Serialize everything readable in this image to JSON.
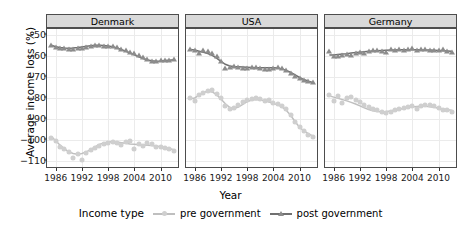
{
  "chart_data": {
    "type": "scatter",
    "title": "",
    "xlabel": "Year",
    "ylabel": "Average income loss (%)",
    "xlim": [
      1984,
      2014
    ],
    "ylim": [
      -114,
      -47
    ],
    "xticks": [
      1986,
      1992,
      1998,
      2004,
      2010
    ],
    "yticks": [
      -50,
      -60,
      -70,
      -80,
      -90,
      -100,
      -110
    ],
    "grid": true,
    "legend_position": "bottom",
    "legend_title": "Income type",
    "facet_variable": "country",
    "facets": [
      "Denmark",
      "USA",
      "Germany"
    ],
    "series_names": [
      "pre government",
      "post government"
    ],
    "colors": {
      "pre_government": "#cfcfcf",
      "post_government": "#8c8c8c",
      "pre_government_line": "#bfbfbf",
      "post_government_line": "#707070",
      "strip_background": "#d9d9d9",
      "panel_border": "#4d4d4d",
      "gridline": "#ebebeb",
      "text": "#000000"
    },
    "panels": [
      {
        "name": "Denmark",
        "series": [
          {
            "name": "pre government",
            "marker": "circle",
            "x": [
              1985,
              1986,
              1987,
              1988,
              1989,
              1990,
              1991,
              1992,
              1993,
              1994,
              1995,
              1996,
              1997,
              1998,
              1999,
              2000,
              2001,
              2002,
              2003,
              2004,
              2005,
              2006,
              2007,
              2008,
              2009,
              2010,
              2011,
              2012,
              2013
            ],
            "y": [
              -99.0,
              -100.5,
              -103.5,
              -104.5,
              -106.0,
              -108.5,
              -107.0,
              -109.5,
              -106.5,
              -105.0,
              -104.0,
              -103.0,
              -102.0,
              -101.5,
              -101.0,
              -101.5,
              -102.5,
              -101.0,
              -100.5,
              -104.5,
              -102.0,
              -103.0,
              -101.5,
              -102.0,
              -103.5,
              -103.5,
              -104.0,
              -104.5,
              -105.5
            ],
            "smooth": [
              -98.5,
              -100.5,
              -102.6,
              -104.4,
              -105.8,
              -106.6,
              -106.9,
              -106.6,
              -105.8,
              -104.7,
              -103.4,
              -102.3,
              -101.5,
              -101.1,
              -101.0,
              -101.1,
              -101.4,
              -101.7,
              -102.0,
              -102.2,
              -102.4,
              -102.5,
              -102.6,
              -102.8,
              -103.0,
              -103.3,
              -103.7,
              -104.2,
              -104.8
            ]
          },
          {
            "name": "post government",
            "marker": "triangle",
            "x": [
              1985,
              1986,
              1987,
              1988,
              1989,
              1990,
              1991,
              1992,
              1993,
              1994,
              1995,
              1996,
              1997,
              1998,
              1999,
              2000,
              2001,
              2002,
              2003,
              2004,
              2005,
              2006,
              2007,
              2008,
              2009,
              2010,
              2011,
              2012,
              2013
            ],
            "y": [
              -54.5,
              -55.5,
              -56.0,
              -56.0,
              -56.5,
              -56.5,
              -56.0,
              -56.0,
              -55.5,
              -55.0,
              -54.5,
              -54.5,
              -55.0,
              -55.0,
              -55.0,
              -55.5,
              -56.5,
              -57.0,
              -58.0,
              -58.5,
              -59.5,
              -60.5,
              -61.5,
              -62.5,
              -62.5,
              -62.0,
              -62.0,
              -62.0,
              -61.5
            ],
            "smooth": [
              -54.8,
              -55.5,
              -55.9,
              -56.1,
              -56.2,
              -56.1,
              -55.9,
              -55.6,
              -55.3,
              -55.0,
              -54.8,
              -54.8,
              -54.9,
              -55.1,
              -55.5,
              -56.1,
              -56.8,
              -57.6,
              -58.5,
              -59.4,
              -60.3,
              -61.1,
              -61.8,
              -62.2,
              -62.4,
              -62.3,
              -62.1,
              -61.9,
              -61.7
            ]
          }
        ]
      },
      {
        "name": "USA",
        "series": [
          {
            "name": "pre government",
            "marker": "circle",
            "x": [
              1985,
              1986,
              1987,
              1988,
              1989,
              1990,
              1991,
              1992,
              1993,
              1994,
              1995,
              1996,
              1997,
              1998,
              1999,
              2000,
              2001,
              2002,
              2003,
              2004,
              2005,
              2006,
              2007,
              2008,
              2009,
              2010,
              2011,
              2012,
              2013
            ],
            "y": [
              -80.0,
              -81.5,
              -78.5,
              -77.5,
              -76.5,
              -76.0,
              -78.0,
              -80.0,
              -84.0,
              -85.5,
              -85.0,
              -83.5,
              -82.0,
              -81.0,
              -80.5,
              -80.0,
              -80.5,
              -81.5,
              -81.0,
              -82.5,
              -83.0,
              -84.0,
              -85.5,
              -88.0,
              -91.5,
              -94.0,
              -96.0,
              -97.5,
              -98.5
            ],
            "smooth": [
              -80.4,
              -80.0,
              -78.6,
              -77.4,
              -76.8,
              -77.1,
              -78.4,
              -80.5,
              -82.8,
              -84.5,
              -85.0,
              -84.4,
              -83.1,
              -81.8,
              -81.0,
              -80.7,
              -80.9,
              -81.4,
              -82.0,
              -82.6,
              -83.3,
              -84.3,
              -86.0,
              -88.4,
              -91.4,
              -94.0,
              -95.8,
              -97.1,
              -98.2
            ]
          },
          {
            "name": "post government",
            "marker": "triangle",
            "x": [
              1985,
              1986,
              1987,
              1988,
              1989,
              1990,
              1991,
              1992,
              1993,
              1994,
              1995,
              1996,
              1997,
              1998,
              1999,
              2000,
              2001,
              2002,
              2003,
              2004,
              2005,
              2006,
              2007,
              2008,
              2009,
              2010,
              2011,
              2012,
              2013
            ],
            "y": [
              -56.5,
              -57.0,
              -58.5,
              -57.0,
              -57.5,
              -58.5,
              -60.0,
              -62.5,
              -65.5,
              -65.0,
              -64.5,
              -65.0,
              -65.5,
              -65.5,
              -65.0,
              -65.0,
              -65.5,
              -66.0,
              -66.0,
              -65.5,
              -65.0,
              -65.5,
              -66.5,
              -68.0,
              -69.5,
              -70.5,
              -71.5,
              -72.0,
              -72.5
            ],
            "smooth": [
              -56.8,
              -57.1,
              -57.6,
              -58.1,
              -58.7,
              -59.6,
              -60.9,
              -62.5,
              -63.9,
              -64.7,
              -65.0,
              -65.1,
              -65.2,
              -65.3,
              -65.4,
              -65.5,
              -65.6,
              -65.6,
              -65.6,
              -65.6,
              -65.7,
              -66.1,
              -66.8,
              -67.8,
              -69.0,
              -70.2,
              -71.2,
              -72.0,
              -72.6
            ]
          }
        ]
      },
      {
        "name": "Germany",
        "series": [
          {
            "name": "pre government",
            "marker": "circle",
            "x": [
              1985,
              1986,
              1987,
              1988,
              1989,
              1990,
              1991,
              1992,
              1993,
              1994,
              1995,
              1996,
              1997,
              1998,
              1999,
              2000,
              2001,
              2002,
              2003,
              2004,
              2005,
              2006,
              2007,
              2008,
              2009,
              2010,
              2011,
              2012,
              2013
            ],
            "y": [
              -78.5,
              -81.5,
              -79.0,
              -82.5,
              -80.0,
              -79.5,
              -81.0,
              -82.0,
              -83.5,
              -84.5,
              -85.5,
              -86.0,
              -86.5,
              -87.0,
              -86.5,
              -86.0,
              -85.5,
              -85.0,
              -84.5,
              -84.0,
              -85.5,
              -84.0,
              -83.5,
              -83.5,
              -84.0,
              -85.0,
              -86.0,
              -86.0,
              -86.5
            ],
            "smooth": [
              -79.0,
              -79.6,
              -80.2,
              -80.8,
              -81.4,
              -82.1,
              -82.9,
              -83.8,
              -84.7,
              -85.5,
              -86.1,
              -86.5,
              -86.6,
              -86.5,
              -86.2,
              -85.8,
              -85.4,
              -85.0,
              -84.6,
              -84.3,
              -84.1,
              -84.0,
              -84.0,
              -84.2,
              -84.5,
              -84.9,
              -85.3,
              -85.6,
              -85.9
            ]
          },
          {
            "name": "post government",
            "marker": "triangle",
            "x": [
              1985,
              1986,
              1987,
              1988,
              1989,
              1990,
              1991,
              1992,
              1993,
              1994,
              1995,
              1996,
              1997,
              1998,
              1999,
              2000,
              2001,
              2002,
              2003,
              2004,
              2005,
              2006,
              2007,
              2008,
              2009,
              2010,
              2011,
              2012,
              2013
            ],
            "y": [
              -57.5,
              -60.0,
              -60.0,
              -59.5,
              -59.0,
              -59.5,
              -58.5,
              -58.0,
              -58.5,
              -57.5,
              -57.0,
              -57.0,
              -57.5,
              -58.0,
              -56.5,
              -57.0,
              -56.5,
              -57.0,
              -56.5,
              -56.0,
              -57.0,
              -56.5,
              -56.5,
              -57.0,
              -57.0,
              -57.0,
              -56.5,
              -57.5,
              -58.0
            ],
            "smooth": [
              -59.5,
              -59.4,
              -59.2,
              -59.0,
              -58.8,
              -58.5,
              -58.3,
              -58.1,
              -57.9,
              -57.7,
              -57.5,
              -57.4,
              -57.3,
              -57.2,
              -57.1,
              -57.0,
              -56.9,
              -56.9,
              -56.9,
              -56.9,
              -56.9,
              -57.0,
              -57.0,
              -57.1,
              -57.2,
              -57.3,
              -57.4,
              -57.5,
              -57.6
            ]
          }
        ]
      }
    ]
  },
  "axes": {
    "y_title": "Average income loss (%)",
    "x_title": "Year",
    "y_tick_labels": [
      "-50",
      "-60",
      "-70",
      "-80",
      "-90",
      "-100",
      "-110"
    ],
    "x_tick_labels": [
      "1986",
      "1992",
      "1998",
      "2004",
      "2010"
    ]
  },
  "strips": {
    "denmark": "Denmark",
    "usa": "USA",
    "germany": "Germany"
  },
  "legend": {
    "title": "Income type",
    "items": [
      {
        "label": "pre government",
        "glyph": "circle-marker-icon"
      },
      {
        "label": "post government",
        "glyph": "triangle-marker-icon"
      }
    ]
  }
}
